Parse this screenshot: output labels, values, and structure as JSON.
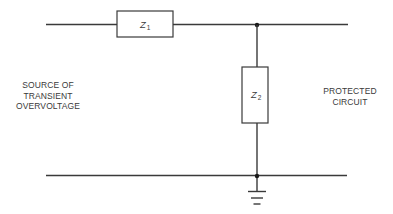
{
  "diagram": {
    "components": [
      {
        "id": "Z1",
        "symbol": "Z",
        "subscript": "1",
        "type": "series impedance"
      },
      {
        "id": "Z2",
        "symbol": "Z",
        "subscript": "2",
        "type": "shunt impedance"
      }
    ],
    "labels": {
      "source": [
        "SOURCE OF",
        "TRANSIENT",
        "OVERVOLTAGE"
      ],
      "protected": [
        "PROTECTED",
        "CIRCUIT"
      ]
    },
    "ground": "ground-symbol",
    "colors": {
      "line": "#3a3a3a",
      "background": "#ffffff"
    }
  }
}
